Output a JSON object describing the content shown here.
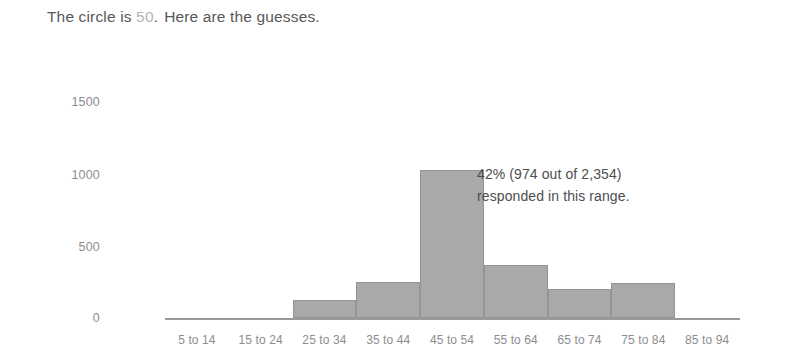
{
  "headline": {
    "prefix": "The circle is",
    "circle_value": "50",
    "suffix": ".",
    "rest": "Here are the guesses."
  },
  "annotation": {
    "line1": "42% (974 out of 2,354)",
    "line2": "responded in this range."
  },
  "colors": {
    "bar_fill": "#a9a9a9",
    "bar_border": "#949494",
    "axis": "#9a9a9a",
    "tick_text": "#8d8d8f",
    "body_text": "#58585a",
    "accent_value": "#b3b3b5"
  },
  "chart_data": {
    "type": "bar",
    "title": "",
    "xlabel": "",
    "ylabel": "",
    "categories": [
      "5 to 14",
      "15 to 24",
      "25 to 34",
      "35 to 44",
      "45 to 54",
      "55 to 64",
      "65 to 74",
      "75 to 84",
      "85 to 94"
    ],
    "values": [
      0,
      0,
      120,
      240,
      974,
      350,
      190,
      230,
      0
    ],
    "ylim": [
      0,
      1500
    ],
    "yticks": [
      0,
      500,
      1000,
      1500
    ],
    "ytick_labels": [
      "0",
      "500",
      "1000",
      "1500"
    ],
    "grid": false,
    "legend": null,
    "highlight_category": "45 to 54",
    "highlight_value": 974,
    "total_responses": 2354,
    "highlight_percent": "42%",
    "annotations": [
      {
        "text": "42% (974 out of 2,354) responded in this range.",
        "attached_to": "45 to 54"
      }
    ]
  }
}
